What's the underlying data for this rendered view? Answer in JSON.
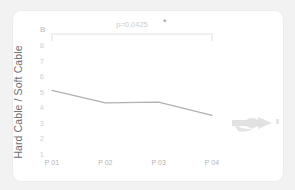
{
  "panel": {
    "label": "B"
  },
  "colors": {
    "background": "#f2f2f2",
    "card": "#ffffff",
    "card_border": "#ededed",
    "line": "#b0b0b0",
    "bracket": "#e2e2e2",
    "axis_text": "#c8c8c8",
    "title_text": "#6e6e6e",
    "glyph": "#cccccc"
  },
  "annotation": {
    "p_value_text": "p=0.0425",
    "significance_star": "*"
  },
  "glyph": {
    "name": "arrow-pointer-glyph"
  },
  "chart_data": {
    "type": "line",
    "title": "",
    "subtitle": "",
    "xlabel": "",
    "ylabel": "Hard Cable / Soft Cable",
    "categories": [
      "P 01",
      "P 02",
      "P 03",
      "P 04"
    ],
    "values": [
      5.15,
      4.35,
      4.4,
      3.55
    ],
    "series": [
      {
        "name": "Hard Cable / Soft Cable",
        "values": [
          5.15,
          4.35,
          4.4,
          3.55
        ]
      }
    ],
    "ylim": [
      1,
      8
    ],
    "yticks": [
      8,
      7,
      6,
      5,
      4,
      3,
      2,
      1
    ],
    "ytick_labels": [
      "8",
      "7",
      "6",
      "5",
      "4",
      "3",
      "2",
      "1"
    ],
    "grid": false,
    "legend": "none",
    "annotations": [
      {
        "text": "p=0.0425",
        "star": "*",
        "from": "P 01",
        "to": "P 04",
        "kind": "significance-bracket"
      }
    ]
  }
}
